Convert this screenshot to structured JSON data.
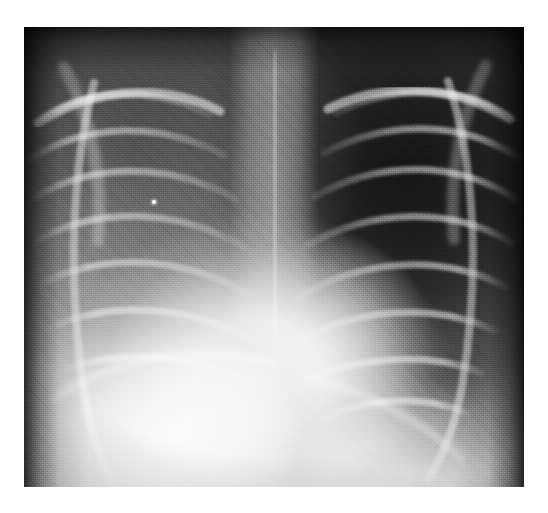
{
  "image": {
    "kind": "chest-radiograph",
    "modality": "X-ray",
    "projection": "PA (frontal) chest",
    "color_mode": "grayscale",
    "canvas": {
      "width": 548,
      "height": 513,
      "background": "#ffffff"
    },
    "film": {
      "left": 24,
      "top": 27,
      "width": 500,
      "height": 460
    },
    "palette": {
      "page_background": "#ffffff",
      "film_darkest": "#101010",
      "film_dark": "#2b2b2b",
      "film_mid": "#8a8a8a",
      "film_light": "#cfcfcf",
      "film_brightest": "#fcfcfc"
    },
    "caption": "",
    "labels": [],
    "annotations": []
  },
  "regions": [
    {
      "name": "left-lung-field-image-right",
      "tone": "dark",
      "note": "well-aerated, rib arcs clearly outlined"
    },
    {
      "name": "right-lung-field-image-left",
      "tone": "hazy-mid-grey",
      "note": "veiled opacification over lower zone"
    },
    {
      "name": "mediastinum-spine",
      "tone": "bright-vertical-band"
    },
    {
      "name": "cardiac-silhouette",
      "tone": "bright",
      "note": "enlarged, displaced toward image left"
    },
    {
      "name": "diaphragm-subdiaphragmatic",
      "tone": "near-white"
    },
    {
      "name": "collimation-border",
      "tone": "near-black"
    }
  ],
  "markers": [
    {
      "name": "bright-speck-artifact",
      "x": 128,
      "y": 173,
      "size": 4
    }
  ],
  "bones": {
    "right_ribs": [
      "M 10,96 C 60,60 128,58 186,88",
      "M 6,132 C 62,96 136,94 200,128",
      "M 8,172 C 66,136 144,134 212,172",
      "M 12,214 C 70,180 152,180 220,220",
      "M 18,256 C 78,226 160,228 226,268",
      "M 28,300 C 86,274 166,278 226,312",
      "M 42,342 C 96,322 168,328 222,352"
    ],
    "left_ribs": [
      "M 490,92 C 440,58 372,56 312,86",
      "M 494,130 C 438,94 364,92 300,126",
      "M 492,172 C 434,134 356,132 290,170",
      "M 488,216 C 430,180 348,180 280,220",
      "M 482,260 C 422,228 340,230 274,270",
      "M 472,304 C 414,276 334,280 274,314",
      "M 458,346 C 404,324 332,330 278,354",
      "M 444,386 C 396,366 340,372 296,392"
    ],
    "clavicles": [
      "M 14,96 C 70,60 140,56 196,84",
      "M 486,92 C 430,58 360,54 304,82"
    ],
    "scapulae": [
      "M 40,40 C 66,88 80,148 74,214",
      "M 462,38 C 438,86 424,148 430,212"
    ],
    "lateral_chest_wall": [
      "M 424,54 C 452,140 456,250 438,360 C 430,404 418,432 404,452",
      "M 70,56 C 48,140 44,246 58,352 C 64,398 74,428 86,450"
    ],
    "spine": "M 250,34 L 252,300",
    "diaphragm_right": "M 30,372 C 96,326 176,318 250,336",
    "diaphragm_left": "M 288,352 C 344,366 400,394 438,432"
  }
}
